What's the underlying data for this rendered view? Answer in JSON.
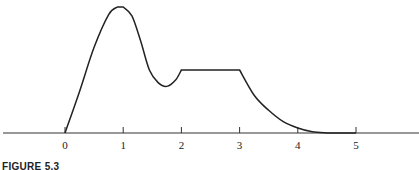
{
  "chart_data": {
    "type": "line",
    "title": "",
    "caption": "FIGURE 5.3",
    "xlabel": "",
    "ylabel": "",
    "xlim": [
      -1.1,
      6.1
    ],
    "x_ticks": [
      0,
      1,
      2,
      3,
      4,
      5
    ],
    "x_tick_labels": [
      "0",
      "1",
      "2",
      "3",
      "4",
      "5"
    ],
    "y_axis_shown": false,
    "grid": false,
    "legend": null,
    "series": [
      {
        "name": "density curve",
        "description": "Curve rises from 0 at x=0 to a peak near x=1, dips to a trough near x=1.7, rises sharply back to a flat plateau at x=2, stays constant until x=3, then decays toward 0 reaching the axis around x=4.5 and stays at 0 until x=5.",
        "points": [
          [
            0,
            0.0
          ],
          [
            0.25,
            0.33
          ],
          [
            0.5,
            0.68
          ],
          [
            0.75,
            0.94
          ],
          [
            0.9,
            1.0
          ],
          [
            1.0,
            1.0
          ],
          [
            1.15,
            0.93
          ],
          [
            1.3,
            0.73
          ],
          [
            1.45,
            0.5
          ],
          [
            1.6,
            0.4
          ],
          [
            1.75,
            0.37
          ],
          [
            1.9,
            0.42
          ],
          [
            2.0,
            0.5
          ],
          [
            2.0,
            0.5
          ],
          [
            2.5,
            0.5
          ],
          [
            3.0,
            0.5
          ],
          [
            3.25,
            0.3
          ],
          [
            3.5,
            0.18
          ],
          [
            3.75,
            0.09
          ],
          [
            4.0,
            0.04
          ],
          [
            4.25,
            0.01
          ],
          [
            4.5,
            0.0
          ],
          [
            5.0,
            0.0
          ]
        ]
      }
    ]
  }
}
